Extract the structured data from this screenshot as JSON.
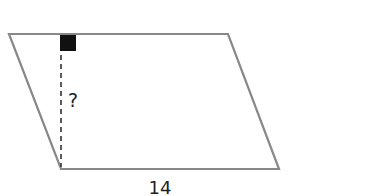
{
  "diagram": {
    "shape": "parallelogram",
    "base_label": "14",
    "height_label": "?",
    "colors": {
      "outline": "#888888",
      "height_line": "#333333",
      "right_angle_marker": "#111111",
      "text": "#222222"
    },
    "vertices": {
      "top_left": [
        9,
        34
      ],
      "top_right": [
        228,
        34
      ],
      "bottom_right": [
        279,
        169
      ],
      "bottom_left": [
        61,
        169
      ]
    }
  }
}
